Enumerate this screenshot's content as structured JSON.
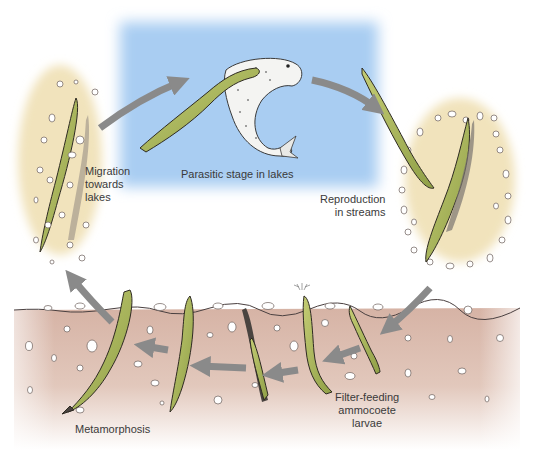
{
  "diagram": {
    "labels": {
      "parasitic": "Parasitic stage in lakes",
      "migration_1": "Migration",
      "migration_2": "towards",
      "migration_3": "lakes",
      "reproduction_1": "Reproduction",
      "reproduction_2": "in streams",
      "filter_1": "Filter-feeding",
      "filter_2": "ammocoete",
      "filter_3": "larvae",
      "metamorphosis": "Metamorphosis"
    },
    "colors": {
      "lake": "#a9cdf2",
      "sediment": "#d9b8aa",
      "nest": "#f3e7c4",
      "lamprey": "#a9b85a",
      "arrow": "#8a8a8a",
      "text": "#3a3a3a"
    },
    "stages": [
      "Parasitic stage in lakes",
      "Reproduction in streams",
      "Filter-feeding ammocoete larvae",
      "Metamorphosis",
      "Migration towards lakes"
    ]
  }
}
